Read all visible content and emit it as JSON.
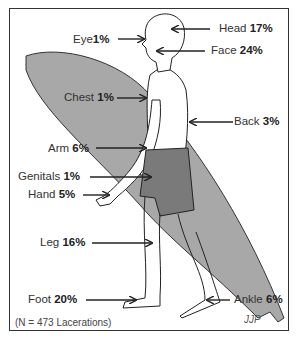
{
  "diagram": {
    "labels": [
      {
        "id": "head",
        "name": "Head",
        "pct": "17%"
      },
      {
        "id": "eye",
        "name": "Eye",
        "pct": "1%"
      },
      {
        "id": "face",
        "name": "Face",
        "pct": "24%"
      },
      {
        "id": "chest",
        "name": "Chest",
        "pct": "1%"
      },
      {
        "id": "back",
        "name": "Back",
        "pct": "3%"
      },
      {
        "id": "arm",
        "name": "Arm",
        "pct": "6%"
      },
      {
        "id": "genitals",
        "name": "Genitals",
        "pct": "1%"
      },
      {
        "id": "hand",
        "name": "Hand",
        "pct": "5%"
      },
      {
        "id": "leg",
        "name": "Leg",
        "pct": "16%"
      },
      {
        "id": "foot",
        "name": "Foot",
        "pct": "20%"
      },
      {
        "id": "ankle",
        "name": "Ankle",
        "pct": "6%"
      }
    ],
    "note": "(N = 473 Lacerations)",
    "signature": "JJP",
    "colors": {
      "board": "#a8a8a8",
      "shorts": "#7a7a7a",
      "outline": "#222222",
      "text": "#333333"
    }
  }
}
